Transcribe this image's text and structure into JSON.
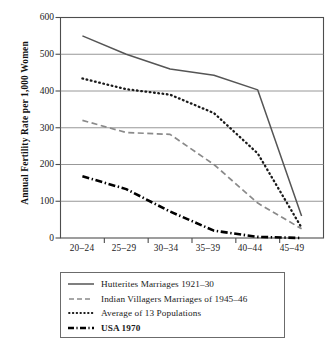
{
  "chart_data": {
    "type": "line",
    "title": "",
    "xlabel": "",
    "ylabel": "Annual Fertility Rate per 1,000 Women",
    "categories": [
      "20–24",
      "25–29",
      "30–34",
      "35–39",
      "40–44",
      "45–49"
    ],
    "ylim": [
      0,
      600
    ],
    "yticks": [
      0,
      100,
      200,
      300,
      400,
      500,
      600
    ],
    "ytick_labels": [
      "0",
      "100",
      "200",
      "300",
      "400",
      "500",
      "600"
    ],
    "grid": "horizontal",
    "legend_position": "below-axes",
    "series": [
      {
        "name": "Hutterites Marriages 1921–30",
        "style": "solid",
        "color": "#555555",
        "values": [
          550,
          500,
          460,
          443,
          403,
          60
        ]
      },
      {
        "name": "Indian Villagers Marriages of 1945–46",
        "style": "dashed",
        "color": "#8a8a8a",
        "values": [
          320,
          287,
          282,
          200,
          95,
          25
        ]
      },
      {
        "name": "Average of 13 Populations",
        "style": "dotted",
        "color": "#1a1a1a",
        "values": [
          434,
          405,
          390,
          340,
          230,
          28
        ]
      },
      {
        "name": "USA 1970",
        "style": "dashdot",
        "color": "#000000",
        "values": [
          168,
          133,
          72,
          20,
          3,
          0
        ]
      }
    ]
  },
  "axis": {
    "ylabel": "Annual Fertility Rate per 1,000 Women",
    "ytick_labels": [
      "600",
      "500",
      "400",
      "300",
      "200",
      "100",
      "0"
    ],
    "xtick_labels": [
      "20–24",
      "25–29",
      "30–34",
      "35–39",
      "40–44",
      "45–49"
    ]
  },
  "legend": {
    "items": [
      {
        "label": "Hutterites Marriages 1921–30",
        "style": "solid"
      },
      {
        "label": "Indian Villagers Marriages of 1945–46",
        "style": "dashed"
      },
      {
        "label": "Average of 13 Populations",
        "style": "dotted"
      },
      {
        "label": "USA 1970",
        "style": "dashdot"
      }
    ]
  }
}
